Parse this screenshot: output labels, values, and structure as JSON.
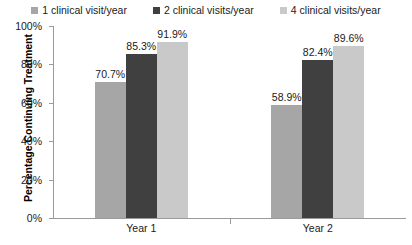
{
  "chart_data": {
    "type": "bar",
    "title": "",
    "xlabel": "",
    "ylabel": "Percentage Continuing Treatment",
    "categories": [
      "Year 1",
      "Year 2"
    ],
    "ylim": [
      0,
      100
    ],
    "ytick_labels": [
      "0%",
      "20%",
      "40%",
      "60%",
      "80%",
      "100%"
    ],
    "ytick_values": [
      0,
      20,
      40,
      60,
      80,
      100
    ],
    "grid": false,
    "legend_position": "top-center",
    "value_label_suffix": "%",
    "series": [
      {
        "name": "1 clinical visit/year",
        "color": "#a6a6a6",
        "values": [
          70.7,
          89.6
        ],
        "value_labels": [
          "70.7%",
          "58.9%"
        ]
      },
      {
        "name": "2 clinical visits/year",
        "color": "#404040",
        "values": [
          85.3,
          82.4
        ],
        "value_labels": [
          "85.3%",
          "82.4%"
        ]
      },
      {
        "name": "4 clinical visits/year",
        "color": "#c9c9c9",
        "values": [
          91.9,
          89.6
        ],
        "value_labels": [
          "91.9%",
          "89.6%"
        ]
      }
    ],
    "data_table": [
      {
        "group": "Year 1",
        "1 clinical visit/year": 70.7,
        "2 clinical visits/year": 85.3,
        "4 clinical visits/year": 91.9
      },
      {
        "group": "Year 2",
        "1 clinical visit/year": 58.9,
        "2 clinical visits/year": 82.4,
        "4 clinical visits/year": 89.6
      }
    ]
  },
  "colors": {
    "axis": "#9a9a9a",
    "text": "#1a1a1a",
    "background": "#ffffff"
  }
}
